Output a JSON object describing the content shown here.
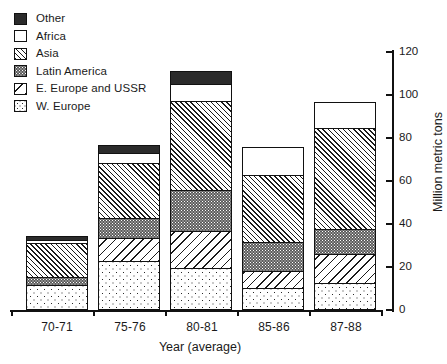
{
  "chart_data": {
    "type": "bar",
    "subtype": "stacked",
    "title": "",
    "xlabel": "Year (average)",
    "ylabel": "Million metric tons",
    "categories": [
      "70-71",
      "75-76",
      "80-81",
      "85-86",
      "87-88"
    ],
    "ylim": [
      0,
      120
    ],
    "yticks": [
      0,
      20,
      40,
      60,
      80,
      100,
      120
    ],
    "grid": false,
    "legend_position": "top-left",
    "stack_order_bottom_to_top": [
      "W. Europe",
      "E. Europe and USSR",
      "Latin America",
      "Asia",
      "Africa",
      "Other"
    ],
    "series": [
      {
        "name": "W. Europe",
        "pattern": "sparse-dots",
        "values": [
          11.6,
          22.8,
          19.5,
          10.2,
          12.6
        ]
      },
      {
        "name": "E. Europe and USSR",
        "pattern": "back-diagonal",
        "values": [
          0.0,
          11.2,
          17.7,
          8.4,
          14.0
        ]
      },
      {
        "name": "Latin America",
        "pattern": "dark-stipple",
        "values": [
          4.2,
          9.8,
          19.5,
          14.0,
          12.1
        ]
      },
      {
        "name": "Asia",
        "pattern": "forward-diagonal",
        "values": [
          16.3,
          26.0,
          41.9,
          31.6,
          47.4
        ]
      },
      {
        "name": "Africa",
        "pattern": "white",
        "values": [
          1.9,
          5.1,
          8.4,
          13.5,
          12.6
        ]
      },
      {
        "name": "Other",
        "pattern": "solid-dark",
        "values": [
          2.3,
          4.2,
          6.5,
          0.0,
          0.0
        ]
      }
    ],
    "totals": [
      36.3,
      79.1,
      113.5,
      77.7,
      98.7
    ]
  },
  "legend": {
    "items": [
      {
        "label": "Other",
        "pattern": "solid-dark"
      },
      {
        "label": "Africa",
        "pattern": "white"
      },
      {
        "label": "Asia",
        "pattern": "forward-diagonal"
      },
      {
        "label": "Latin America",
        "pattern": "dark-stipple"
      },
      {
        "label": "E. Europe and USSR",
        "pattern": "back-diagonal"
      },
      {
        "label": "W. Europe",
        "pattern": "sparse-dots"
      }
    ]
  },
  "axes": {
    "x_title": "Year (average)",
    "x_tick_labels": [
      "70-71",
      "75-76",
      "80-81",
      "85-86",
      "87-88"
    ],
    "y_title": "Million metric tons",
    "y_tick_labels": [
      "0",
      "20",
      "40",
      "60",
      "80",
      "100",
      "120"
    ]
  },
  "colors": {
    "ink": "#111111",
    "solid_dark": "#2b2b2b",
    "stipple_gray": "#5b5b5b",
    "background": "#ffffff"
  }
}
